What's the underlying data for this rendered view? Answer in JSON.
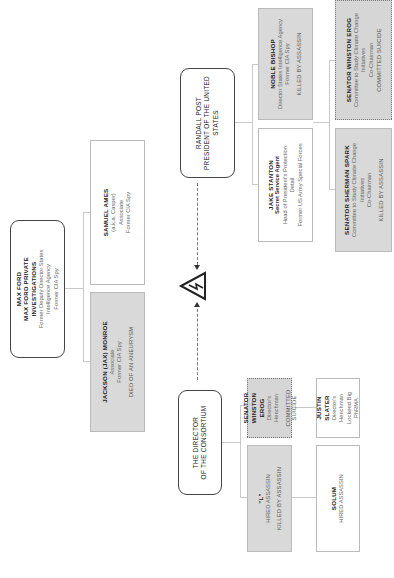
{
  "diagram": {
    "orientation": "rotated-90-ccw",
    "hazard_icon": "high-voltage-warning-icon",
    "nodes": {
      "max_ford": {
        "name": "MAX FORD",
        "org": "MAX FORD PRIVATE INVESTIGATIONS",
        "lines": [
          "Former Deputy Director States",
          "Intelligence Agency",
          "Former CIA Spy"
        ]
      },
      "samuel_ames": {
        "name": "SAMUEL AMES",
        "lines": [
          "(a.k.a. Casper)",
          "Associate",
          "Former CIA Spy"
        ]
      },
      "jackson_monroe": {
        "name": "JACKSON (JAX) MONROE",
        "lines": [
          "Associate",
          "Former CIA Spy"
        ],
        "status": "DIED OF AN ANEURYSM"
      },
      "randall_post": {
        "name": "RANDALL POST",
        "title_line1": "PRESIDENT OF THE UNITED",
        "title_line2": "STATES"
      },
      "noble_bishop": {
        "name": "NOBLE BISHOP",
        "lines": [
          "Director States Intelligence Agency",
          "Former CIA Spy"
        ],
        "status": "KILLED BY ASSASSIN"
      },
      "jake_stanton": {
        "name": "JAKE STANTON",
        "role": "Secret Service Agent",
        "lines": [
          "Head of President's Protection",
          "Detail",
          "Former US Army Special Forces"
        ]
      },
      "senator_erog_committee": {
        "name": "SENATOR WINSTON EROG",
        "lines": [
          "Committee to Study Climate Change",
          "Initiatives",
          "Co-Chairman"
        ],
        "status": "COMMITTED SUICIDE"
      },
      "senator_spark": {
        "name": "SENATOR SHERMAN SPARK",
        "lines": [
          "Committee to Study Climate Change",
          "Initiatives",
          "Co-Chairman"
        ],
        "status": "KILLED BY ASSASSIN"
      },
      "director": {
        "title_line1": "THE DIRECTOR",
        "title_line2": "OF THE CONSORTIUM"
      },
      "senator_erog_henchman": {
        "name": "SENATOR WINSTON EROG",
        "lines": [
          "Director's Henchman"
        ],
        "status": "COMMITTED SUICIDE"
      },
      "l": {
        "name": "\"L\"",
        "lines": [
          "HIRED ASSASSIN"
        ],
        "status": "KILLED BY ASSASSIN"
      },
      "justin_slater": {
        "name": "JUSTIN SLATER",
        "lines": [
          "Director's Henchman",
          "Lockeed Big PhRMA"
        ]
      },
      "solum": {
        "name": "SOLUM",
        "lines": [
          "HIRED ASSASSIN"
        ]
      }
    }
  }
}
